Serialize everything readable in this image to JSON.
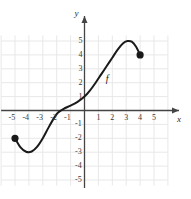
{
  "chart_data": {
    "type": "line",
    "title": "",
    "xlabel": "x",
    "ylabel": "y",
    "xlim": [
      -6,
      6
    ],
    "ylim": [
      -5.5,
      5.5
    ],
    "grid": true,
    "grid_color": "#e8e8e8",
    "axis_color": "#444444",
    "curve_color": "#1a1a1a",
    "legend": "none",
    "xticks": [
      -5,
      -4,
      -3,
      -2,
      -1,
      1,
      2,
      3,
      4,
      5
    ],
    "xtick_labels": [
      "-5",
      "-4",
      "-3",
      "-2",
      "-1",
      "1",
      "2",
      "3",
      "4",
      "5"
    ],
    "yticks": [
      5,
      4,
      3,
      2,
      1,
      -1,
      -2,
      -3,
      -4,
      -5
    ],
    "ytick_labels": [
      "5",
      "4",
      "3",
      "2",
      "1",
      "-1",
      "-2",
      "-3",
      "-4",
      "-5"
    ],
    "annotations": [
      {
        "name": "curve-label-f",
        "text": "f",
        "x": 1.75,
        "y": 2.3
      }
    ],
    "series": [
      {
        "name": "f",
        "points": [
          [
            -5.0,
            -2.0
          ],
          [
            -4.6,
            -2.65
          ],
          [
            -4.2,
            -2.97
          ],
          [
            -3.8,
            -2.95
          ],
          [
            -3.4,
            -2.6
          ],
          [
            -3.0,
            -2.0
          ],
          [
            -2.6,
            -1.25
          ],
          [
            -2.2,
            -0.55
          ],
          [
            -1.9,
            -0.15
          ],
          [
            -1.5,
            0.12
          ],
          [
            -1.0,
            0.35
          ],
          [
            -0.5,
            0.62
          ],
          [
            0.0,
            1.0
          ],
          [
            0.4,
            1.45
          ],
          [
            0.8,
            2.0
          ],
          [
            1.2,
            2.6
          ],
          [
            1.6,
            3.2
          ],
          [
            2.0,
            3.8
          ],
          [
            2.4,
            4.4
          ],
          [
            2.8,
            4.85
          ],
          [
            3.1,
            5.0
          ],
          [
            3.4,
            4.95
          ],
          [
            3.7,
            4.6
          ],
          [
            4.0,
            4.0
          ]
        ],
        "endpoints": [
          {
            "name": "left-endpoint",
            "x": -5.0,
            "y": -2.0,
            "filled": true
          },
          {
            "name": "right-endpoint",
            "x": 4.0,
            "y": 4.0,
            "filled": true
          }
        ]
      }
    ]
  }
}
